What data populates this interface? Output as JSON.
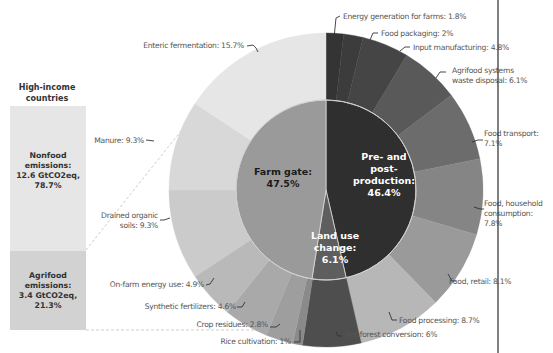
{
  "chart_data": {
    "type": "pie",
    "subtype": "nested-donut",
    "title": "",
    "side_bar": {
      "title_line1": "High-income",
      "title_line2": "countries",
      "segments": [
        {
          "label_line1": "Nonfood",
          "label_line2": "emissions:",
          "label_line3": "12.6 GtCO2eq,",
          "label_line4": "78.7%",
          "value": 78.7,
          "gtco2eq": 12.6,
          "color": "#e6e6e6"
        },
        {
          "label_line1": "Agrifood",
          "label_line2": "emissions:",
          "label_line3": "3.4 GtCO2eq,",
          "label_line4": "21.3%",
          "value": 21.3,
          "gtco2eq": 3.4,
          "color": "#d2d2d2"
        }
      ]
    },
    "inner_ring": [
      {
        "name": "Pre- and post-production",
        "line1": "Pre- and",
        "line2": "post-",
        "line3": "production:",
        "line4": "46.4%",
        "value": 46.4,
        "color": "#2f2f2f",
        "text_color": "#ffffff"
      },
      {
        "name": "Land use change",
        "line1": "Land use",
        "line2": "change:",
        "line3": "6.1%",
        "value": 6.1,
        "color": "#5e5e5e",
        "text_color": "#ffffff"
      },
      {
        "name": "Farm gate",
        "line1": "Farm gate:",
        "line2": "47.5%",
        "value": 47.5,
        "color": "#9a9a9a",
        "text_color": "#1a1a1a"
      }
    ],
    "outer_ring": [
      {
        "name": "Energy generation for farms",
        "label": "Energy generation for farms: 1.8%",
        "value": 1.8,
        "color": "#343434"
      },
      {
        "name": "Food packaging",
        "label": "Food packaging: 2%",
        "value": 2.0,
        "color": "#3c3c3c"
      },
      {
        "name": "Input manufacturing",
        "label": "Input manufacturing: 4.8%",
        "value": 4.8,
        "color": "#454545"
      },
      {
        "name": "Agrifood systems waste disposal",
        "label": "Agrifood systems",
        "label2": "waste disposal: 6.1%",
        "value": 6.1,
        "color": "#595959"
      },
      {
        "name": "Food transport",
        "label": "Food transport:",
        "label2": "7.1%",
        "value": 7.1,
        "color": "#6c6c6c"
      },
      {
        "name": "Food, household consumption",
        "label": "Food, household",
        "label2": "consumption:",
        "label3": "7.8%",
        "value": 7.8,
        "color": "#858585"
      },
      {
        "name": "Food, retail",
        "label": "Food, retail: 8.1%",
        "value": 8.1,
        "color": "#9a9a9a"
      },
      {
        "name": "Food processing",
        "label": "Food processing: 8.7%",
        "value": 8.7,
        "color": "#b7b7b7"
      },
      {
        "name": "Net forest conversion",
        "label": "Net forest conversion: 6%",
        "value": 6.0,
        "color": "#4e4e4e"
      },
      {
        "name": "Rice cultivation",
        "label": "Rice cultivation: 1%",
        "value": 1.0,
        "color": "#8a8a8a"
      },
      {
        "name": "Crop residues",
        "label": "Crop residues: 2.8%",
        "value": 2.8,
        "color": "#9e9e9e"
      },
      {
        "name": "Synthetic fertilizers",
        "label": "Synthetic fertilizers: 4.6%",
        "value": 4.6,
        "color": "#a9a9a9"
      },
      {
        "name": "On-farm energy use",
        "label": "On-farm energy use: 4.9%",
        "value": 4.9,
        "color": "#b9b9b9"
      },
      {
        "name": "Drained organic soils",
        "label": "Drained organic",
        "label2": "soils: 9.3%",
        "value": 9.3,
        "color": "#cbcbcb"
      },
      {
        "name": "Manure",
        "label": "Manure: 9.3%",
        "value": 9.3,
        "color": "#d8d8d8"
      },
      {
        "name": "Enteric fermentation",
        "label": "Enteric fermentation: 15.7%",
        "value": 15.7,
        "color": "#e6e6e6"
      }
    ],
    "legend": "none",
    "units": "% of agrifood emissions"
  }
}
